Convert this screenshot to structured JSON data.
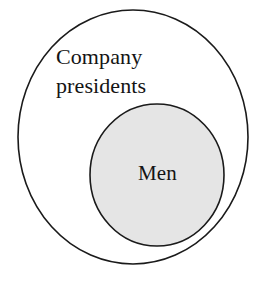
{
  "diagram": {
    "type": "euler-diagram",
    "title": "",
    "background_color": "#ffffff",
    "outer_set": {
      "label": "Company\npresidents",
      "label_line_1": "Company",
      "label_line_2": "presidents",
      "shape": "circle",
      "fill_color": "#ffffff",
      "stroke_color": "#1a1a1a",
      "stroke_width": 1.6,
      "center_x": 133,
      "center_y": 137,
      "radius_x": 115,
      "radius_y": 127
    },
    "inner_set": {
      "label": "Men",
      "shape": "circle",
      "fill_color": "#e5e5e5",
      "stroke_color": "#1a1a1a",
      "stroke_width": 1.6,
      "center_x": 157,
      "center_y": 175,
      "radius_x": 67,
      "radius_y": 71
    },
    "relationship": "Men is a proper subset of Company presidents"
  }
}
